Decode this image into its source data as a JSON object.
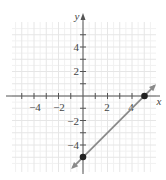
{
  "chart_data": {
    "type": "line",
    "title": "",
    "xlabel": "x",
    "ylabel": "y",
    "xlim": [
      -6,
      6
    ],
    "ylim": [
      -6,
      6
    ],
    "grid": true,
    "x_ticks": [
      -4,
      -2,
      2,
      4
    ],
    "y_ticks": [
      4,
      2,
      -2,
      -4
    ],
    "x_tick_labels": [
      "−4",
      "−2",
      "2",
      "4"
    ],
    "y_tick_labels": [
      "4",
      "2",
      "−2",
      "−4"
    ],
    "series": [
      {
        "name": "line",
        "equation": "y = x - 5",
        "x": [
          0,
          5
        ],
        "y": [
          -5,
          0
        ],
        "arrows": "both",
        "color": "#888888"
      }
    ],
    "points": [
      {
        "x": 0,
        "y": -5,
        "label": "y-intercept"
      },
      {
        "x": 5,
        "y": 0,
        "label": "x-intercept"
      }
    ],
    "colors": {
      "grid": "#e6e6e6",
      "axis": "#555555",
      "line": "#8a8a8a",
      "point": "#222222"
    }
  }
}
